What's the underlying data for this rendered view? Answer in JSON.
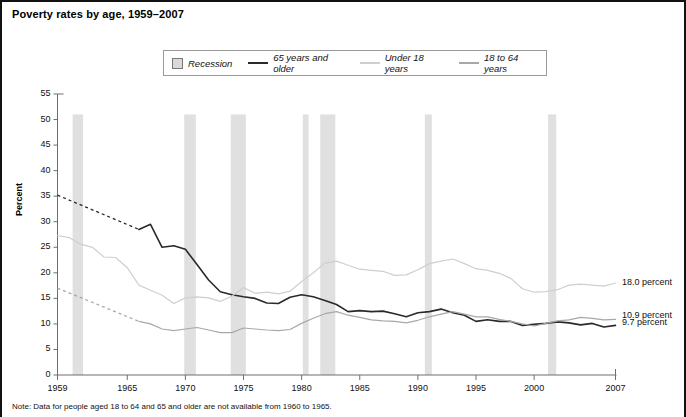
{
  "title": "Poverty rates by age, 1959–2007",
  "note": "Note: Data for people aged 18 to 64 and 65 and older are not available from 1960 to 1965.",
  "legend": {
    "recession": "Recession",
    "s65": "65 years and older",
    "sUnder18": "Under 18 years",
    "s18to64": "18 to 64 years"
  },
  "axis": {
    "ylabel": "Percent",
    "yticks": [
      0,
      5,
      10,
      15,
      20,
      25,
      30,
      35,
      40,
      45,
      50,
      55
    ],
    "xticks": [
      1959,
      1965,
      1970,
      1975,
      1980,
      1985,
      1990,
      1995,
      2000,
      2007
    ]
  },
  "endLabels": {
    "s65": "18.0 percent",
    "sUnder18": "10.9 percent",
    "s18to64": "9.7 percent"
  },
  "colors": {
    "s65": "#2a2a2a",
    "sUnder18": "#cfcfcf",
    "s18to64": "#a8a8a8",
    "recession": "#e0e0e0",
    "axis": "#6e6e6e"
  },
  "chart_data": {
    "type": "line",
    "title": "Poverty rates by age, 1959–2007",
    "xlabel": "",
    "ylabel": "Percent",
    "xlim": [
      1959,
      2007
    ],
    "ylim": [
      0,
      55
    ],
    "grid": false,
    "legend_position": "top",
    "annotations": [
      {
        "text": "18.0 percent",
        "series": "Under 18 years",
        "x": 2007,
        "y": 18.0
      },
      {
        "text": "10.9 percent",
        "series": "18 to 64 years",
        "x": 2007,
        "y": 10.9
      },
      {
        "text": "9.7 percent",
        "series": "65 years and older",
        "x": 2007,
        "y": 9.7
      }
    ],
    "recession_bands": [
      {
        "start": 1960.3,
        "end": 1961.2
      },
      {
        "start": 1969.9,
        "end": 1970.9
      },
      {
        "start": 1973.9,
        "end": 1975.2
      },
      {
        "start": 1980.1,
        "end": 1980.6
      },
      {
        "start": 1981.6,
        "end": 1982.9
      },
      {
        "start": 1990.6,
        "end": 1991.2
      },
      {
        "start": 2001.2,
        "end": 2001.9
      }
    ],
    "x": [
      1959,
      1960,
      1961,
      1962,
      1963,
      1964,
      1965,
      1966,
      1967,
      1968,
      1969,
      1970,
      1971,
      1972,
      1973,
      1974,
      1975,
      1976,
      1977,
      1978,
      1979,
      1980,
      1981,
      1982,
      1983,
      1984,
      1985,
      1986,
      1987,
      1988,
      1989,
      1990,
      1991,
      1992,
      1993,
      1994,
      1995,
      1996,
      1997,
      1998,
      1999,
      2000,
      2001,
      2002,
      2003,
      2004,
      2005,
      2006,
      2007
    ],
    "series": [
      {
        "name": "65 years and older",
        "color": "#2a2a2a",
        "dashed_from": 1959,
        "dashed_to": 1966,
        "values": [
          35.2,
          null,
          null,
          null,
          null,
          null,
          null,
          28.5,
          29.5,
          25.0,
          25.3,
          24.6,
          21.6,
          18.6,
          16.3,
          15.7,
          15.3,
          15.0,
          14.1,
          14.0,
          15.2,
          15.7,
          15.3,
          14.6,
          13.8,
          12.4,
          12.6,
          12.4,
          12.5,
          12.0,
          11.4,
          12.2,
          12.4,
          12.9,
          12.2,
          11.7,
          10.5,
          10.8,
          10.5,
          10.5,
          9.7,
          9.9,
          10.1,
          10.4,
          10.2,
          9.8,
          10.1,
          9.4,
          9.7
        ]
      },
      {
        "name": "Under 18 years",
        "color": "#cfcfcf",
        "values": [
          27.3,
          26.9,
          25.6,
          25.0,
          23.1,
          23.0,
          21.0,
          17.6,
          16.6,
          15.6,
          14.0,
          15.1,
          15.3,
          15.1,
          14.4,
          15.4,
          17.1,
          16.0,
          16.2,
          15.9,
          16.4,
          18.3,
          20.0,
          21.9,
          22.3,
          21.5,
          20.7,
          20.5,
          20.3,
          19.5,
          19.6,
          20.6,
          21.8,
          22.3,
          22.7,
          21.8,
          20.8,
          20.5,
          19.9,
          18.9,
          16.9,
          16.2,
          16.3,
          16.7,
          17.6,
          17.8,
          17.6,
          17.4,
          18.0
        ]
      },
      {
        "name": "18 to 64 years",
        "color": "#a8a8a8",
        "dashed_from": 1959,
        "dashed_to": 1966,
        "values": [
          17.0,
          null,
          null,
          null,
          null,
          null,
          null,
          10.5,
          10.0,
          9.0,
          8.7,
          9.0,
          9.3,
          8.8,
          8.3,
          8.3,
          9.2,
          9.0,
          8.8,
          8.7,
          8.9,
          10.1,
          11.1,
          12.0,
          12.4,
          11.7,
          11.3,
          10.8,
          10.6,
          10.5,
          10.2,
          10.7,
          11.4,
          11.9,
          12.4,
          11.9,
          11.4,
          11.4,
          10.9,
          10.5,
          10.0,
          9.6,
          10.1,
          10.6,
          10.8,
          11.3,
          11.1,
          10.8,
          10.9
        ]
      }
    ]
  }
}
